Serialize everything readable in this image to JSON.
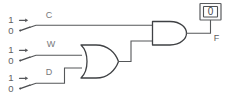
{
  "diagram": {
    "background_color": "#ffffff",
    "wire_color": "#555759",
    "gate_stroke_color": "#3f4144",
    "text_color": "#5b5d60"
  },
  "switches": [
    {
      "id": "switch-c",
      "signal_label": "C",
      "high_terminal_label": "1",
      "low_terminal_label": "0",
      "position": "low"
    },
    {
      "id": "switch-w",
      "signal_label": "W",
      "high_terminal_label": "1",
      "low_terminal_label": "0",
      "position": "low"
    },
    {
      "id": "switch-d",
      "signal_label": "D",
      "high_terminal_label": "1",
      "low_terminal_label": "0",
      "position": "low"
    }
  ],
  "gates": [
    {
      "id": "or-gate",
      "type": "OR",
      "inputs": [
        "W",
        "D"
      ]
    },
    {
      "id": "and-gate",
      "type": "AND",
      "inputs": [
        "C",
        "or-gate"
      ]
    }
  ],
  "output": {
    "id": "output-f",
    "label": "F",
    "display_value": "0"
  }
}
